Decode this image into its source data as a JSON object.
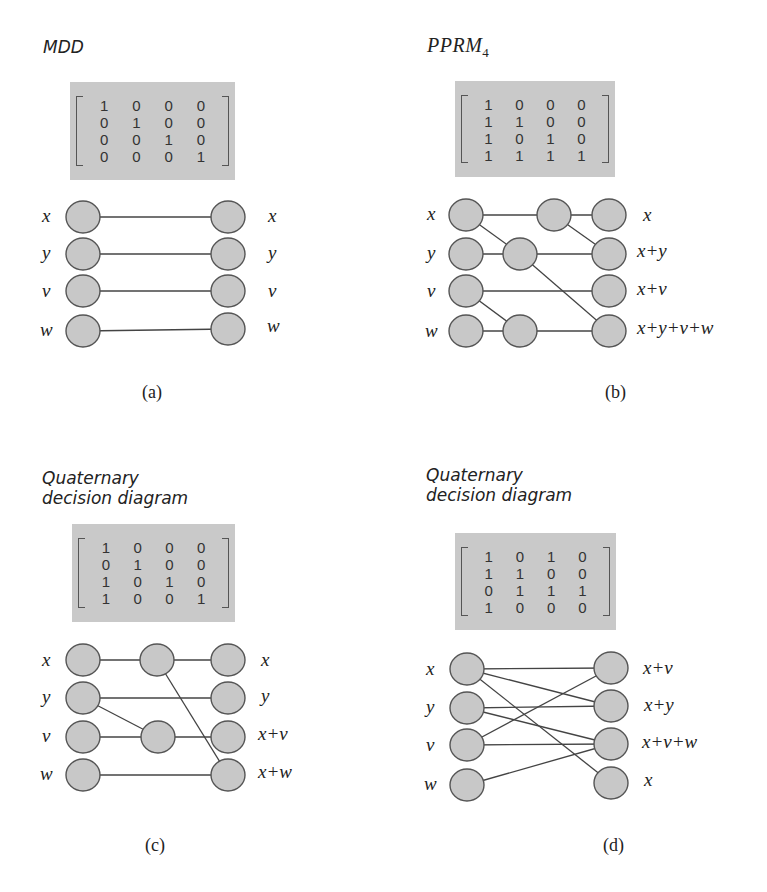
{
  "figure": {
    "colors": {
      "matrix_bg": "#c9c9c9",
      "node_fill": "#c8c8c8",
      "node_stroke": "#555555",
      "edge": "#444444"
    },
    "panels": [
      {
        "id": "a",
        "title": "MDD",
        "title_style": "sans",
        "title_pos": [
          43,
          37
        ],
        "caption": "(a)",
        "caption_pos": [
          142,
          382
        ],
        "matrix": {
          "box": [
            70,
            82,
            165,
            98
          ],
          "rows": [
            [
              "1",
              "0",
              "0",
              "0"
            ],
            [
              "0",
              "1",
              "0",
              "0"
            ],
            [
              "0",
              "0",
              "1",
              "0"
            ],
            [
              "0",
              "0",
              "0",
              "1"
            ]
          ]
        },
        "nodes": [
          {
            "id": "Lx",
            "cx": 83,
            "cy": 217
          },
          {
            "id": "Ly",
            "cx": 83,
            "cy": 254
          },
          {
            "id": "Lv",
            "cx": 83,
            "cy": 291
          },
          {
            "id": "Lw",
            "cx": 83,
            "cy": 331
          },
          {
            "id": "R1",
            "cx": 228,
            "cy": 217
          },
          {
            "id": "R2",
            "cx": 228,
            "cy": 254
          },
          {
            "id": "R3",
            "cx": 228,
            "cy": 291
          },
          {
            "id": "R4",
            "cx": 228,
            "cy": 329
          }
        ],
        "edges": [
          [
            "Lx",
            "R1"
          ],
          [
            "Ly",
            "R2"
          ],
          [
            "Lv",
            "R3"
          ],
          [
            "Lw",
            "R4"
          ]
        ],
        "input_labels": [
          {
            "text": "x",
            "x": 42,
            "y": 206
          },
          {
            "text": "y",
            "x": 42,
            "y": 243
          },
          {
            "text": "v",
            "x": 42,
            "y": 281
          },
          {
            "text": "w",
            "x": 40,
            "y": 320
          }
        ],
        "output_labels": [
          {
            "text": "x",
            "x": 268,
            "y": 206
          },
          {
            "text": "y",
            "x": 268,
            "y": 243
          },
          {
            "text": "v",
            "x": 268,
            "y": 281
          },
          {
            "text": "w",
            "x": 267,
            "y": 316
          }
        ]
      },
      {
        "id": "b",
        "title": "PPRM",
        "title_sub": "4",
        "title_style": "serif",
        "title_pos": [
          427,
          35
        ],
        "caption": "(b)",
        "caption_pos": [
          605,
          382
        ],
        "matrix": {
          "box": [
            455,
            81,
            160,
            96
          ],
          "rows": [
            [
              "1",
              "0",
              "0",
              "0"
            ],
            [
              "1",
              "1",
              "0",
              "0"
            ],
            [
              "1",
              "0",
              "1",
              "0"
            ],
            [
              "1",
              "1",
              "1",
              "1"
            ]
          ]
        },
        "nodes": [
          {
            "id": "Lx",
            "cx": 466,
            "cy": 215
          },
          {
            "id": "Ly",
            "cx": 466,
            "cy": 254
          },
          {
            "id": "Lv",
            "cx": 466,
            "cy": 291
          },
          {
            "id": "Lw",
            "cx": 466,
            "cy": 331
          },
          {
            "id": "M1",
            "cx": 554,
            "cy": 215
          },
          {
            "id": "M2",
            "cx": 520,
            "cy": 254
          },
          {
            "id": "M3",
            "cx": 520,
            "cy": 331
          },
          {
            "id": "R1",
            "cx": 609,
            "cy": 215
          },
          {
            "id": "R2",
            "cx": 609,
            "cy": 254
          },
          {
            "id": "R3",
            "cx": 609,
            "cy": 291
          },
          {
            "id": "R4",
            "cx": 609,
            "cy": 331
          }
        ],
        "edges": [
          [
            "Lx",
            "M1"
          ],
          [
            "M1",
            "R1"
          ],
          [
            "M1",
            "R2"
          ],
          [
            "Lx",
            "M2"
          ],
          [
            "Ly",
            "M2"
          ],
          [
            "M2",
            "R2"
          ],
          [
            "M2",
            "R4"
          ],
          [
            "Lv",
            "R3"
          ],
          [
            "Lv",
            "M3"
          ],
          [
            "Lw",
            "M3"
          ],
          [
            "M3",
            "R4"
          ]
        ],
        "input_labels": [
          {
            "text": "x",
            "x": 427,
            "y": 204
          },
          {
            "text": "y",
            "x": 427,
            "y": 243
          },
          {
            "text": "v",
            "x": 427,
            "y": 281
          },
          {
            "text": "w",
            "x": 425,
            "y": 321
          }
        ],
        "output_labels": [
          {
            "text": "x",
            "x": 643,
            "y": 205
          },
          {
            "text": "x+y",
            "x": 637,
            "y": 241
          },
          {
            "text": "x+v",
            "x": 637,
            "y": 279
          },
          {
            "text": "x+y+v+w",
            "x": 637,
            "y": 318
          }
        ]
      },
      {
        "id": "c",
        "title": "Quaternary\ndecision diagram",
        "title_style": "sans",
        "title_pos": [
          42,
          468
        ],
        "caption": "(c)",
        "caption_pos": [
          145,
          835
        ],
        "matrix": {
          "box": [
            72,
            524,
            163,
            98
          ],
          "rows": [
            [
              "1",
              "0",
              "0",
              "0"
            ],
            [
              "0",
              "1",
              "0",
              "0"
            ],
            [
              "1",
              "0",
              "1",
              "0"
            ],
            [
              "1",
              "0",
              "0",
              "1"
            ]
          ]
        },
        "nodes": [
          {
            "id": "Lx",
            "cx": 83,
            "cy": 660
          },
          {
            "id": "Ly",
            "cx": 83,
            "cy": 698
          },
          {
            "id": "Lv",
            "cx": 83,
            "cy": 737
          },
          {
            "id": "Lw",
            "cx": 83,
            "cy": 775
          },
          {
            "id": "M1",
            "cx": 157,
            "cy": 660
          },
          {
            "id": "M2",
            "cx": 158,
            "cy": 737
          },
          {
            "id": "R1",
            "cx": 228,
            "cy": 660
          },
          {
            "id": "R2",
            "cx": 228,
            "cy": 698
          },
          {
            "id": "R3",
            "cx": 228,
            "cy": 737
          },
          {
            "id": "R4",
            "cx": 228,
            "cy": 775
          }
        ],
        "edges": [
          [
            "Lx",
            "M1"
          ],
          [
            "M1",
            "R1"
          ],
          [
            "M1",
            "R4"
          ],
          [
            "Ly",
            "R2"
          ],
          [
            "Ly",
            "M2"
          ],
          [
            "Lv",
            "M2"
          ],
          [
            "M2",
            "R3"
          ],
          [
            "Lw",
            "R4"
          ]
        ],
        "input_labels": [
          {
            "text": "x",
            "x": 42,
            "y": 650
          },
          {
            "text": "y",
            "x": 42,
            "y": 687
          },
          {
            "text": "v",
            "x": 42,
            "y": 726
          },
          {
            "text": "w",
            "x": 40,
            "y": 764
          }
        ],
        "output_labels": [
          {
            "text": "x",
            "x": 261,
            "y": 650
          },
          {
            "text": "y",
            "x": 261,
            "y": 686
          },
          {
            "text": "x+v",
            "x": 258,
            "y": 724
          },
          {
            "text": "x+w",
            "x": 258,
            "y": 762
          }
        ]
      },
      {
        "id": "d",
        "title": "Quaternary\ndecision diagram",
        "title_style": "sans",
        "title_pos": [
          426,
          465
        ],
        "caption": "(d)",
        "caption_pos": [
          603,
          835
        ],
        "matrix": {
          "box": [
            455,
            533,
            161,
            97
          ],
          "rows": [
            [
              "1",
              "0",
              "1",
              "0"
            ],
            [
              "1",
              "1",
              "0",
              "0"
            ],
            [
              "0",
              "1",
              "1",
              "1"
            ],
            [
              "1",
              "0",
              "0",
              "0"
            ]
          ]
        },
        "nodes": [
          {
            "id": "Lx",
            "cx": 467,
            "cy": 669
          },
          {
            "id": "Ly",
            "cx": 467,
            "cy": 708
          },
          {
            "id": "Lv",
            "cx": 467,
            "cy": 745
          },
          {
            "id": "Lw",
            "cx": 467,
            "cy": 785
          },
          {
            "id": "R1",
            "cx": 611,
            "cy": 668
          },
          {
            "id": "R2",
            "cx": 611,
            "cy": 706
          },
          {
            "id": "R3",
            "cx": 611,
            "cy": 744
          },
          {
            "id": "R4",
            "cx": 611,
            "cy": 783
          }
        ],
        "edges": [
          [
            "Lx",
            "R1"
          ],
          [
            "Lx",
            "R2"
          ],
          [
            "Lx",
            "R4"
          ],
          [
            "Ly",
            "R2"
          ],
          [
            "Ly",
            "R3"
          ],
          [
            "Lv",
            "R1"
          ],
          [
            "Lv",
            "R3"
          ],
          [
            "Lw",
            "R3"
          ]
        ],
        "input_labels": [
          {
            "text": "x",
            "x": 426,
            "y": 659
          },
          {
            "text": "y",
            "x": 426,
            "y": 697
          },
          {
            "text": "v",
            "x": 426,
            "y": 735
          },
          {
            "text": "w",
            "x": 424,
            "y": 774
          }
        ],
        "output_labels": [
          {
            "text": "x+v",
            "x": 643,
            "y": 658
          },
          {
            "text": "x+y",
            "x": 644,
            "y": 695
          },
          {
            "text": "x+v+w",
            "x": 642,
            "y": 732
          },
          {
            "text": "x",
            "x": 644,
            "y": 770
          }
        ]
      }
    ]
  }
}
